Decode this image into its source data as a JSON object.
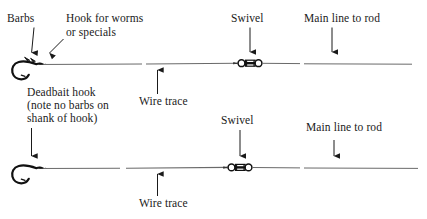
{
  "figure": {
    "ink_color": "#1a1a1a",
    "line_color": "#5f5f5f",
    "background": "#ffffff"
  },
  "rigs": [
    {
      "name": "worm-or-special-hook-rig",
      "hook_label": "Hook for worms\nor specials",
      "barbs_label": "Barbs",
      "wire_trace_label": "Wire trace",
      "swivel_label": "Swivel",
      "main_line_label": "Main line to rod",
      "hook_has_barbs_on_shank": "yes"
    },
    {
      "name": "deadbait-hook-rig",
      "hook_label": "Deadbait hook\n(note no barbs on\nshank of hook)",
      "wire_trace_label": "Wire trace",
      "swivel_label": "Swivel",
      "main_line_label": "Main line to rod",
      "hook_has_barbs_on_shank": "no"
    }
  ],
  "labels": {
    "barbs": "Barbs",
    "hook_for_worms_l1": "Hook for worms",
    "hook_for_worms_l2": "or specials",
    "swivel_top": "Swivel",
    "main_line_top": "Main line to rod",
    "wire_trace_top": "Wire trace",
    "deadbait_l1": "Deadbait hook",
    "deadbait_l2": "(note no barbs on",
    "deadbait_l3": "shank of hook)",
    "swivel_bottom": "Swivel",
    "main_line_bottom": "Main line to rod",
    "wire_trace_bottom": "Wire trace"
  }
}
